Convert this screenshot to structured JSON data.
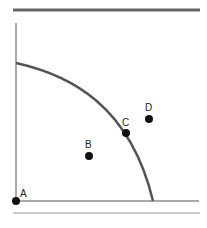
{
  "diagram": {
    "type": "production-possibilities-frontier",
    "colors": {
      "axis": "#555555",
      "curve": "#555555",
      "rule_top": "#666666",
      "rule_bottom": "#999999",
      "point": "#111111"
    },
    "points": [
      {
        "label": "A",
        "x": 16,
        "y": 201,
        "lx": 20,
        "ly": 197
      },
      {
        "label": "B",
        "x": 89,
        "y": 156,
        "lx": 85,
        "ly": 147
      },
      {
        "label": "C",
        "x": 126,
        "y": 133,
        "lx": 122,
        "ly": 126
      },
      {
        "label": "D",
        "x": 149,
        "y": 119,
        "lx": 144,
        "ly": 112
      }
    ]
  }
}
